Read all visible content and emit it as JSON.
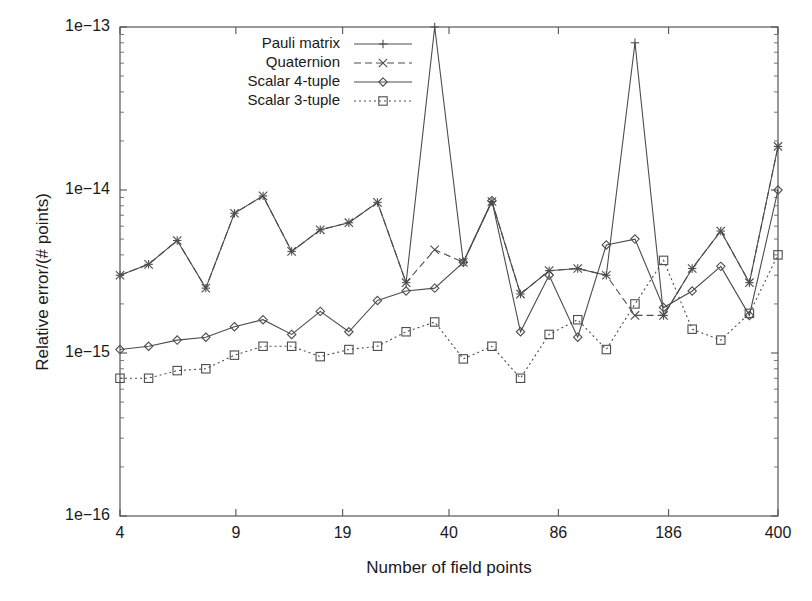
{
  "chart_data": {
    "type": "line",
    "title": "",
    "xlabel": "Number of field points",
    "ylabel": "Relative error/(# points)",
    "xscale": "log",
    "yscale": "log",
    "xlim": [
      4,
      400
    ],
    "ylim": [
      1e-16,
      1e-13
    ],
    "grid": false,
    "legend_position": "top-left inside",
    "xticks": [
      {
        "value": 4,
        "label": "4"
      },
      {
        "value": 9,
        "label": "9"
      },
      {
        "value": 19,
        "label": "19"
      },
      {
        "value": 40,
        "label": "40"
      },
      {
        "value": 86,
        "label": "86"
      },
      {
        "value": 186,
        "label": "186"
      },
      {
        "value": 400,
        "label": "400"
      }
    ],
    "yticks": [
      {
        "value": 1e-13,
        "label": "1e−13"
      },
      {
        "value": 1e-14,
        "label": "1e−14"
      },
      {
        "value": 1e-15,
        "label": "1e−15"
      },
      {
        "value": 1e-16,
        "label": "1e−16"
      }
    ],
    "x": [
      4,
      5,
      7,
      9,
      11,
      13,
      16,
      19,
      23,
      28,
      34,
      40,
      48,
      58,
      70,
      86,
      104,
      125,
      150,
      186,
      220,
      265,
      320,
      400
    ],
    "series": [
      {
        "name": "Pauli matrix",
        "marker": "plus",
        "linestyle": "solid",
        "color": "#4d4d4d",
        "values": [
          3e-15,
          3.5e-15,
          4.9e-15,
          2.5e-15,
          7.2e-15,
          9.2e-15,
          4.2e-15,
          5.7e-15,
          6.3e-15,
          8.4e-15,
          2.7e-15,
          1e-13,
          3.6e-15,
          8.5e-15,
          2.3e-15,
          3.2e-15,
          3.3e-15,
          3e-15,
          8e-14,
          1.7e-15,
          3.3e-15,
          5.6e-15,
          2.7e-15,
          1.85e-14
        ]
      },
      {
        "name": "Quaternion",
        "marker": "cross",
        "linestyle": "dashed",
        "color": "#4d4d4d",
        "values": [
          3e-15,
          3.5e-15,
          4.9e-15,
          2.5e-15,
          7.2e-15,
          9.2e-15,
          4.2e-15,
          5.7e-15,
          6.3e-15,
          8.4e-15,
          2.7e-15,
          4.3e-15,
          3.6e-15,
          8.5e-15,
          2.3e-15,
          3.2e-15,
          3.3e-15,
          3e-15,
          1.7e-15,
          1.7e-15,
          3.3e-15,
          5.6e-15,
          2.7e-15,
          1.85e-14
        ]
      },
      {
        "name": "Scalar 4-tuple",
        "marker": "diamond",
        "linestyle": "solid",
        "color": "#4d4d4d",
        "values": [
          1.05e-15,
          1.1e-15,
          1.2e-15,
          1.25e-15,
          1.45e-15,
          1.6e-15,
          1.3e-15,
          1.8e-15,
          1.35e-15,
          2.1e-15,
          2.4e-15,
          2.5e-15,
          3.6e-15,
          8.6e-15,
          1.35e-15,
          3e-15,
          1.25e-15,
          4.6e-15,
          5e-15,
          1.9e-15,
          2.4e-15,
          3.4e-15,
          1.7e-15,
          1e-14
        ]
      },
      {
        "name": "Scalar 3-tuple",
        "marker": "square",
        "linestyle": "dotted",
        "color": "#4d4d4d",
        "values": [
          7e-16,
          7e-16,
          7.8e-16,
          8e-16,
          9.7e-16,
          1.1e-15,
          1.1e-15,
          9.5e-16,
          1.05e-15,
          1.1e-15,
          1.35e-15,
          1.55e-15,
          9.2e-16,
          1.1e-15,
          7e-16,
          1.3e-15,
          1.6e-15,
          1.05e-15,
          2e-15,
          3.7e-15,
          1.4e-15,
          1.2e-15,
          1.75e-15,
          4e-15
        ]
      }
    ]
  },
  "legend": {
    "entries": [
      {
        "label": "Pauli matrix"
      },
      {
        "label": "Quaternion"
      },
      {
        "label": "Scalar 4-tuple"
      },
      {
        "label": "Scalar 3-tuple"
      }
    ]
  }
}
